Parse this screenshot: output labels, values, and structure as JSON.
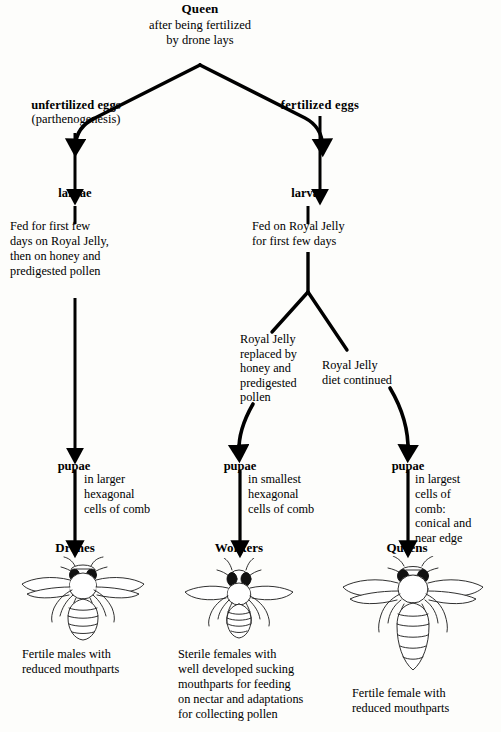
{
  "diagram": {
    "type": "flowchart",
    "nodes": {
      "queen": {
        "title": "Queen",
        "subtitle_line1": "after being fertilized",
        "subtitle_line2": "by drone lays"
      },
      "unfertilized_eggs": {
        "title": "unfertilized eggs",
        "subtitle": "(parthenogenesis)"
      },
      "fertilized_eggs": {
        "title": "fertilized eggs"
      },
      "larvae_left": {
        "title": "larvae"
      },
      "larvae_right": {
        "title": "larvae"
      },
      "feeding_left": {
        "line1": "Fed for first few",
        "line2": "days on Royal Jelly,",
        "line3": "then on honey and",
        "line4": "predigested pollen"
      },
      "feeding_right": {
        "line1": "Fed on Royal Jelly",
        "line2": "for first few days"
      },
      "royal_jelly_replaced": {
        "line1": "Royal Jelly",
        "line2": "replaced by",
        "line3": "honey and",
        "line4": "predigested",
        "line5": "pollen"
      },
      "royal_jelly_continued": {
        "line1": "Royal Jelly",
        "line2": "diet continued"
      },
      "pupae_drone": {
        "title": "pupae",
        "line1": "in larger",
        "line2": "hexagonal",
        "line3": "cells of comb"
      },
      "pupae_worker": {
        "title": "pupae",
        "line1": "in smallest",
        "line2": "hexagonal",
        "line3": "cells of comb"
      },
      "pupae_queen": {
        "title": "pupae",
        "line1": "in largest",
        "line2": "cells of",
        "line3": "comb:",
        "line4": "conical and",
        "line5": "near edge"
      },
      "drones": {
        "title": "Drones",
        "caption_line1": "Fertile males with",
        "caption_line2": "reduced mouthparts"
      },
      "workers": {
        "title": "Workers",
        "caption_line1": "Sterile females with",
        "caption_line2": "well developed sucking",
        "caption_line3": "mouthparts for feeding",
        "caption_line4": "on nectar and adaptations",
        "caption_line5": "for collecting pollen"
      },
      "queens": {
        "title": "Queens",
        "caption_line1": "Fertile female with",
        "caption_line2": "reduced mouthparts"
      }
    },
    "illustrations": [
      {
        "name": "drone-bee-illustration",
        "label": "drone bee"
      },
      {
        "name": "worker-bee-illustration",
        "label": "worker bee"
      },
      {
        "name": "queen-bee-illustration",
        "label": "queen bee"
      }
    ],
    "colors": {
      "ink": "#000000",
      "paper": "#fdfdfb"
    }
  }
}
